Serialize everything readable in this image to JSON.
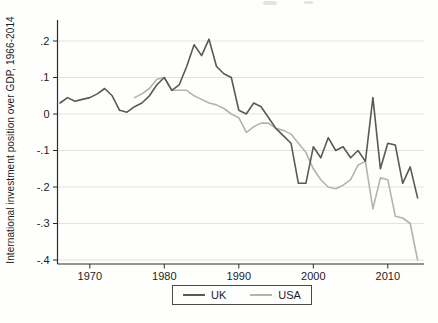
{
  "chart_data": {
    "type": "line",
    "title": "",
    "xlabel": "",
    "ylabel": "International investment position over GDP, 1966-2014",
    "x_ticks": [
      1970,
      1980,
      1990,
      2000,
      2010
    ],
    "y_ticks": [
      {
        "label": ".2",
        "value": 0.2
      },
      {
        "label": ".1",
        "value": 0.1
      },
      {
        "label": "0",
        "value": 0
      },
      {
        "label": "-.1",
        "value": -0.1
      },
      {
        "label": "-.2",
        "value": -0.2
      },
      {
        "label": "-.3",
        "value": -0.3
      },
      {
        "label": "-.4",
        "value": -0.4
      }
    ],
    "xlim": [
      1965.7,
      2014.9
    ],
    "ylim": [
      -0.42,
      0.26
    ],
    "grid": true,
    "legend_position": "bottom-center",
    "series": [
      {
        "name": "UK",
        "color": "#595959",
        "x_start": 1966,
        "x_step": 1,
        "values": [
          0.03,
          0.045,
          0.035,
          0.04,
          0.045,
          0.055,
          0.07,
          0.05,
          0.01,
          0.005,
          0.02,
          0.03,
          0.05,
          0.08,
          0.1,
          0.065,
          0.08,
          0.13,
          0.19,
          0.16,
          0.205,
          0.13,
          0.11,
          0.1,
          0.01,
          0.0,
          0.03,
          0.02,
          -0.01,
          -0.04,
          -0.06,
          -0.08,
          -0.19,
          -0.19,
          -0.09,
          -0.12,
          -0.065,
          -0.1,
          -0.09,
          -0.12,
          -0.1,
          -0.13,
          0.045,
          -0.15,
          -0.08,
          -0.085,
          -0.19,
          -0.145,
          -0.23
        ]
      },
      {
        "name": "USA",
        "color": "#b3b3b3",
        "x_start": 1976,
        "x_step": 1,
        "values": [
          0.045,
          0.055,
          0.07,
          0.095,
          0.1,
          0.065,
          0.065,
          0.065,
          0.05,
          0.04,
          0.03,
          0.025,
          0.015,
          0.0,
          -0.01,
          -0.05,
          -0.035,
          -0.025,
          -0.025,
          -0.04,
          -0.045,
          -0.055,
          -0.08,
          -0.105,
          -0.15,
          -0.18,
          -0.2,
          -0.205,
          -0.195,
          -0.18,
          -0.14,
          -0.13,
          -0.26,
          -0.175,
          -0.18,
          -0.28,
          -0.285,
          -0.3,
          -0.4
        ]
      }
    ]
  }
}
